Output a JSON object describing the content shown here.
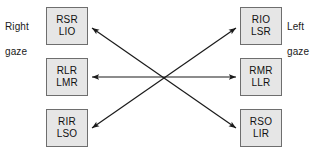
{
  "diagram": {
    "background_color": "#ffffff",
    "box_fill_color": "#e6e6e6",
    "box_border_color": "#6e6e6e",
    "arrow_color": "#1a1a1a",
    "text_color": "#111111",
    "labels": {
      "right_gaze": "Right\ngaze",
      "right_gaze_line1": "Right",
      "right_gaze_line2": "gaze",
      "left_gaze": "Left\ngaze",
      "left_gaze_line1": "Left",
      "left_gaze_line2": "gaze"
    },
    "boxes": {
      "left_top": {
        "line1": "RSR",
        "line2": "LIO",
        "x": 46,
        "y": 7,
        "w": 42,
        "h": 38
      },
      "left_mid": {
        "line1": "RLR",
        "line2": "LMR",
        "x": 46,
        "y": 58,
        "w": 42,
        "h": 38
      },
      "left_bottom": {
        "line1": "RIR",
        "line2": "LSO",
        "x": 46,
        "y": 109,
        "w": 42,
        "h": 38
      },
      "right_top": {
        "line1": "RIO",
        "line2": "LSR",
        "x": 240,
        "y": 7,
        "w": 42,
        "h": 38
      },
      "right_mid": {
        "line1": "RMR",
        "line2": "LLR",
        "x": 240,
        "y": 58,
        "w": 42,
        "h": 38
      },
      "right_bottom": {
        "line1": "RSO",
        "line2": "LIR",
        "x": 240,
        "y": 109,
        "w": 42,
        "h": 38
      }
    },
    "connectors": [
      {
        "name": "diagonal-upleft-downright",
        "from": "left_top",
        "to": "right_bottom",
        "style": "double-headed",
        "x1": 92,
        "y1": 28,
        "x2": 236,
        "y2": 128
      },
      {
        "name": "horizontal-middle",
        "from": "left_mid",
        "to": "right_mid",
        "style": "double-headed",
        "x1": 92,
        "y1": 77,
        "x2": 236,
        "y2": 77
      },
      {
        "name": "diagonal-downleft-upright",
        "from": "left_bottom",
        "to": "right_top",
        "style": "double-headed",
        "x1": 92,
        "y1": 128,
        "x2": 236,
        "y2": 28
      }
    ]
  }
}
